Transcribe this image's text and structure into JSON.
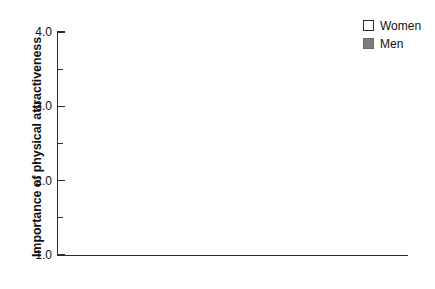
{
  "chart_data": {
    "type": "bar",
    "title": "",
    "subtitle": "",
    "xlabel": "",
    "ylabel": "Importance of physical attractiveness",
    "categories": [
      "United States",
      "Russia",
      "Japan"
    ],
    "series": [
      {
        "name": "Women",
        "values": [
          3.22,
          3.09,
          2.52
        ]
      },
      {
        "name": "Men",
        "values": [
          3.75,
          3.52,
          3.02
        ]
      }
    ],
    "ylim": [
      1.0,
      4.0
    ],
    "y_major_ticks": [
      1.0,
      2.0,
      3.0,
      4.0
    ],
    "y_major_tick_labels": [
      "1.0",
      "2.0",
      "3.0",
      "4.0"
    ],
    "y_minor_ticks": [
      1.5,
      2.5,
      3.5
    ],
    "grid": false,
    "legend_position": "top-right",
    "colors": {
      "women": "#ffffff",
      "men": "#7d7d7d",
      "axis": "#2b2b2b",
      "bar_outline": "#3a3a3a",
      "text": "#111111",
      "background": "#ffffff"
    }
  },
  "axis": {
    "y_label": "Importance of physical attractiveness",
    "y_ticks": [
      {
        "label": "4.0",
        "value": 4.0
      },
      {
        "label": "3.0",
        "value": 3.0
      },
      {
        "label": "2.0",
        "value": 2.0
      },
      {
        "label": "1.0",
        "value": 1.0
      }
    ]
  },
  "legend": {
    "items": [
      {
        "label": "Women",
        "swatch": "legend-swatch-women"
      },
      {
        "label": "Men",
        "swatch": "legend-swatch-men"
      }
    ]
  },
  "categories": [
    {
      "label": "United States"
    },
    {
      "label": "Russia"
    },
    {
      "label": "Japan"
    }
  ]
}
